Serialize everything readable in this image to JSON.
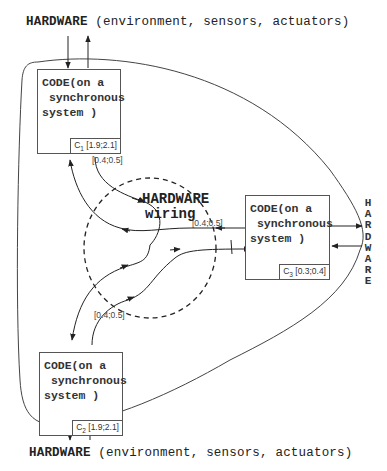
{
  "diagram": {
    "top_label": {
      "hardware": "HARDWARE",
      "rest": " (environment, sensors, actuators)"
    },
    "bottom_label": {
      "hardware": "HARDWARE",
      "rest": " (environment, sensors, actuators)"
    },
    "right_label": {
      "letters": [
        "H",
        "A",
        "R",
        "D",
        "W",
        "A",
        "R",
        "E"
      ]
    },
    "center_label": {
      "line1": "HARDWARE",
      "line2": "wiring"
    },
    "code_boxes": [
      {
        "id": "c1",
        "text": "CODE(on a\n synchronous\nsystem )",
        "clock_name": "C",
        "clock_sub": "1",
        "clock_interval": " [1.9;2.1]"
      },
      {
        "id": "c2",
        "text": "CODE(on a\n synchronous\nsystem )",
        "clock_name": "C",
        "clock_sub": "2",
        "clock_interval": " [1.9;2.1]"
      },
      {
        "id": "c3",
        "text": "CODE(on a\n synchronous\nsystem )",
        "clock_name": "C",
        "clock_sub": "3",
        "clock_interval": " [0.3;0.4]"
      }
    ],
    "delay_intervals": {
      "c1_out": "[0.4;0.5]",
      "c3_in": "[0.4;0.5]",
      "c2_out": "[0.4;0.5]"
    }
  }
}
